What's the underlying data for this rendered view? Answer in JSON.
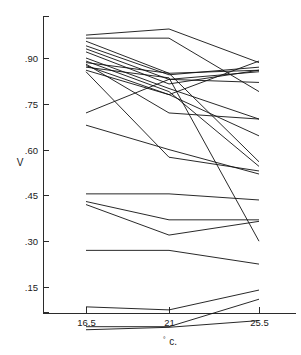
{
  "chart_data": {
    "type": "line",
    "title": "",
    "xlabel": "° c.",
    "ylabel": "V",
    "x": [
      16.5,
      21,
      25.5
    ],
    "xticklabels": [
      "16.5",
      "21",
      "25.5"
    ],
    "yticklabels": [
      ".15",
      ".30",
      ".45",
      ".60",
      ".75",
      ".90"
    ],
    "ytickvalues": [
      0.15,
      0.3,
      0.45,
      0.6,
      0.75,
      0.9
    ],
    "xlim": [
      14.25,
      27.75
    ],
    "ylim": [
      0.0,
      1.0
    ],
    "grid": false,
    "legend": false,
    "legend_position": "none",
    "note": "Profile plot: each line connects one subject measured at three temperatures.",
    "series": [
      {
        "name": "s1",
        "values": [
          0.975,
          0.995,
          0.885
        ]
      },
      {
        "name": "s2",
        "values": [
          0.965,
          0.965,
          0.79
        ]
      },
      {
        "name": "s3",
        "values": [
          0.955,
          0.85,
          0.86
        ]
      },
      {
        "name": "s4",
        "values": [
          0.94,
          0.845,
          0.87
        ]
      },
      {
        "name": "s5",
        "values": [
          0.93,
          0.83,
          0.855
        ]
      },
      {
        "name": "s6",
        "values": [
          0.92,
          0.815,
          0.86
        ]
      },
      {
        "name": "s7",
        "values": [
          0.9,
          0.8,
          0.7
        ]
      },
      {
        "name": "s8",
        "values": [
          0.89,
          0.79,
          0.545
        ]
      },
      {
        "name": "s9",
        "values": [
          0.885,
          0.85,
          0.56
        ]
      },
      {
        "name": "s10",
        "values": [
          0.88,
          0.72,
          0.7
        ]
      },
      {
        "name": "s11",
        "values": [
          0.875,
          0.78,
          0.89
        ]
      },
      {
        "name": "s12",
        "values": [
          0.87,
          0.835,
          0.3
        ]
      },
      {
        "name": "s13",
        "values": [
          0.86,
          0.78,
          0.645
        ]
      },
      {
        "name": "s14",
        "values": [
          0.855,
          0.575,
          0.53
        ]
      },
      {
        "name": "s15",
        "values": [
          0.72,
          0.83,
          0.82
        ]
      },
      {
        "name": "s16",
        "values": [
          0.68,
          0.6,
          0.52
        ]
      },
      {
        "name": "s17",
        "values": [
          0.455,
          0.455,
          0.435
        ]
      },
      {
        "name": "s18",
        "values": [
          0.43,
          0.37,
          0.37
        ]
      },
      {
        "name": "s19",
        "values": [
          0.42,
          0.32,
          0.365
        ]
      },
      {
        "name": "s20",
        "values": [
          0.27,
          0.27,
          0.225
        ]
      },
      {
        "name": "s21",
        "values": [
          0.085,
          0.075,
          0.14
        ]
      },
      {
        "name": "s22",
        "values": [
          0.02,
          0.02,
          0.11
        ]
      },
      {
        "name": "s23",
        "values": [
          0.01,
          0.018,
          0.04
        ]
      }
    ]
  },
  "colors": {
    "line": "#111111",
    "axis": "#2b2b2b",
    "background": "#ffffff",
    "text": "#1a1a1a"
  }
}
